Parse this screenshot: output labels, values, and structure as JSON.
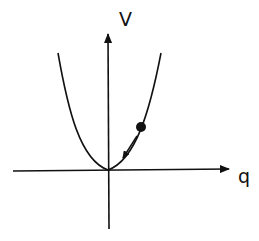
{
  "diagram": {
    "type": "potential-well",
    "y_axis_label": "V",
    "x_axis_label": "q",
    "curve": "parabola V = k q^2",
    "ball": {
      "description": "particle on right side of well"
    },
    "arrow": {
      "description": "motion toward minimum"
    },
    "colors": {
      "stroke": "#111111",
      "background": "#ffffff"
    }
  }
}
